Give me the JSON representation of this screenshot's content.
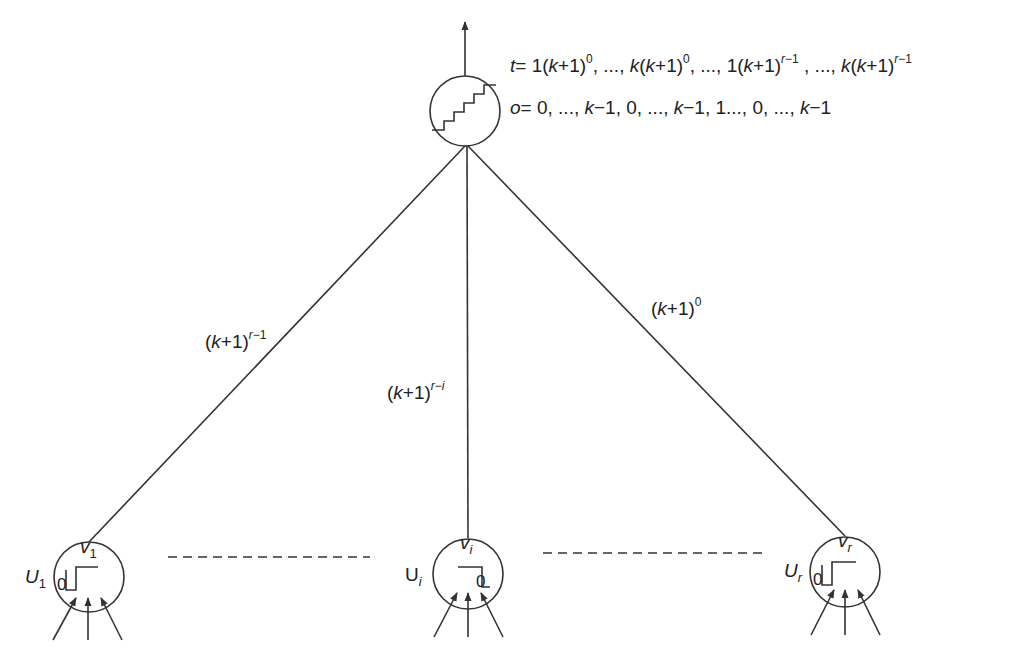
{
  "output_node": {
    "t_sequence": {
      "prefix": "t",
      "terms": [
        "1(k+1)",
        "0",
        "k(k+1)",
        "0",
        "1(k+1)",
        "r−1",
        "k(k+1)",
        "r−1"
      ],
      "text": "t = 1(k+1)^0, ..., k(k+1)^0, ..., 1(k+1)^(r−1), ..., k(k+1)^(r−1)"
    },
    "o_sequence": {
      "text": "o = 0, ..., k−1, 0, ..., k−1, 1..., 0, ..., k−1"
    },
    "icon": "staircase-icon"
  },
  "edges": [
    {
      "from": "U1",
      "weight_base": "(k+1)",
      "weight_exp": "r−1"
    },
    {
      "from": "Ui",
      "weight_base": "(k+1)",
      "weight_exp": "r−i"
    },
    {
      "from": "Ur",
      "weight_base": "(k+1)",
      "weight_exp": "0"
    }
  ],
  "input_units": [
    {
      "name": "U",
      "sub": "1",
      "threshold_label": "v",
      "threshold_sub": "1",
      "zero": "0",
      "step": "step-up"
    },
    {
      "name": "U",
      "sub": "i",
      "threshold_label": "v",
      "threshold_sub": "i",
      "zero": "0",
      "step": "step-down"
    },
    {
      "name": "U",
      "sub": "r",
      "threshold_label": "v",
      "threshold_sub": "r",
      "zero": "0",
      "step": "step-up"
    }
  ]
}
